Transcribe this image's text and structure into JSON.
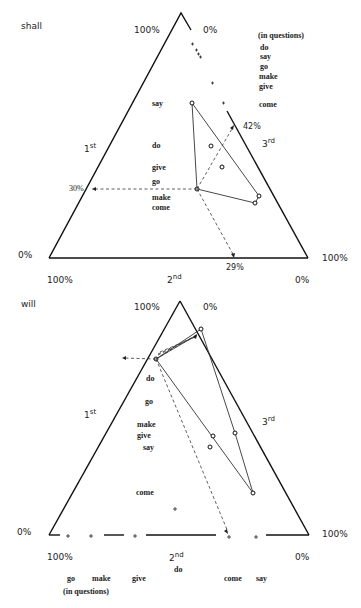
{
  "top": {
    "title": "shall",
    "apex_label": "100%",
    "apex_right_label": "0%",
    "bottom_left_side_label": "0%",
    "bottom_left_label": "100%",
    "bottom_right_side_label": "100%",
    "bottom_right_label": "0%",
    "axis_1": "1",
    "axis_1_sup": "st",
    "axis_2": "2",
    "axis_2_sup": "nd",
    "axis_3": "3",
    "axis_3_sup": "rd",
    "marker_1st": "30%",
    "marker_2nd": "29%",
    "marker_3rd": "42%",
    "in_questions_header": "(in questions)",
    "in_questions_words": [
      "do",
      "say",
      "go",
      "make",
      "give",
      "come"
    ],
    "inside_words": [
      "say",
      "do",
      "give",
      "go",
      "make",
      "come"
    ]
  },
  "bottom": {
    "title": "will",
    "apex_label": "100%",
    "apex_right_label": "0%",
    "bottom_left_side_label": "0%",
    "bottom_left_label": "100%",
    "bottom_right_side_label": "100%",
    "bottom_right_label": "0%",
    "axis_1": "1",
    "axis_1_sup": "st",
    "axis_2": "2",
    "axis_2_sup": "nd",
    "axis_3": "3",
    "axis_3_sup": "rd",
    "inside_words": [
      "do",
      "go",
      "make",
      "give",
      "say",
      "come"
    ],
    "below_words": [
      "go",
      "make",
      "give",
      "do",
      "come",
      "say"
    ],
    "in_questions_label": "(in questions)"
  }
}
